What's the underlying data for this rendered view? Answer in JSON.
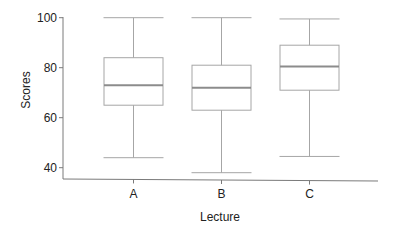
{
  "chart_data": {
    "type": "boxplot",
    "title": "",
    "xlabel": "Lecture",
    "ylabel": "Scores",
    "categories": [
      "A",
      "B",
      "C"
    ],
    "ylim": [
      35,
      100
    ],
    "yticks": [
      40,
      60,
      80,
      100
    ],
    "grid": false,
    "legend": null,
    "boxes": [
      {
        "category": "A",
        "whisker_low": 44,
        "q1": 65,
        "median": 73,
        "q3": 84,
        "whisker_high": 100
      },
      {
        "category": "B",
        "whisker_low": 38,
        "q1": 63,
        "median": 72,
        "q3": 81,
        "whisker_high": 100
      },
      {
        "category": "C",
        "whisker_low": 44.5,
        "q1": 71,
        "median": 80.5,
        "q3": 89,
        "whisker_high": 99.5
      }
    ]
  },
  "colors": {
    "box_line": "#a6a6a6",
    "median_line": "#8c8c8c",
    "axis_line": "#7a7a7a",
    "text": "#222222"
  }
}
